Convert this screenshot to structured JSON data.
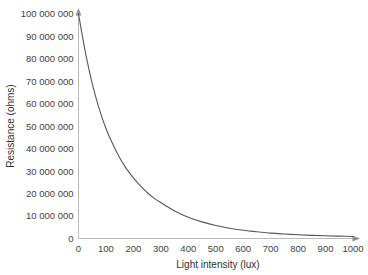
{
  "chart_data": {
    "type": "line",
    "title": "",
    "subtitle": "",
    "xlabel": "Light intensity (lux)",
    "ylabel": "Resistance (ohms)",
    "xlim": [
      0,
      1000
    ],
    "ylim": [
      0,
      100000000
    ],
    "grid": false,
    "legend": false,
    "legend_position": "none",
    "xticks": [
      0,
      100,
      200,
      300,
      400,
      500,
      600,
      700,
      800,
      900,
      1000
    ],
    "xtick_labels": [
      "0",
      "100",
      "200",
      "300",
      "400",
      "500",
      "600",
      "700",
      "800",
      "900",
      "1000"
    ],
    "yticks": [
      0,
      10000000,
      20000000,
      30000000,
      40000000,
      50000000,
      60000000,
      70000000,
      80000000,
      90000000,
      100000000
    ],
    "ytick_labels": [
      "0",
      "10 000 000",
      "20 000 000",
      "30 000 000",
      "40 000 000",
      "50 000 000",
      "60 000 000",
      "70 000 000",
      "80 000 000",
      "90 000 000",
      "100 000 000"
    ],
    "series": [
      {
        "name": "Resistance vs light intensity",
        "color": "#575757",
        "x": [
          0,
          25,
          50,
          75,
          100,
          125,
          150,
          175,
          200,
          225,
          250,
          275,
          300,
          350,
          400,
          450,
          500,
          550,
          600,
          650,
          700,
          750,
          800,
          850,
          900,
          950,
          1000
        ],
        "y": [
          100000000,
          83000000,
          69000000,
          58000000,
          49000000,
          42000000,
          36000000,
          31000000,
          27000000,
          23500000,
          20500000,
          18000000,
          16000000,
          12300000,
          9500000,
          7400000,
          5800000,
          4600000,
          3700000,
          3000000,
          2400000,
          2000000,
          1650000,
          1400000,
          1200000,
          1050000,
          900000
        ]
      }
    ],
    "axes_style": {
      "arrowheads": true,
      "ticks_visible": false,
      "axis_color": "#b9b9b9",
      "background": "#ffffff"
    }
  },
  "axis": {
    "x_title": "Light intensity (lux)",
    "y_title": "Resistance (ohms)"
  }
}
